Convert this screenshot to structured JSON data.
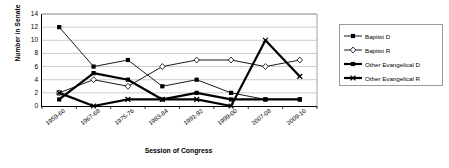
{
  "chart_data": {
    "type": "line",
    "title": "",
    "xlabel": "Session of Congress",
    "ylabel": "Number in Senate",
    "categories": [
      "1959-60",
      "1967-68",
      "1975-76",
      "1983-84",
      "1991-92",
      "1999-00",
      "2007-08",
      "2009-10"
    ],
    "ylim": [
      0,
      14
    ],
    "yticks": [
      0,
      2,
      4,
      6,
      8,
      10,
      12,
      14
    ],
    "grid": true,
    "grid_axis": "y",
    "legend_position": "right",
    "series": [
      {
        "name": "Baptist D",
        "marker": "filled-square",
        "line_width": "thin",
        "color": "#000000",
        "values": [
          12,
          6,
          7,
          3,
          4,
          2,
          1,
          1
        ]
      },
      {
        "name": "Baptist R",
        "marker": "open-diamond",
        "line_width": "thin",
        "color": "#000000",
        "values": [
          2,
          4,
          3,
          6,
          7,
          7,
          6,
          7
        ]
      },
      {
        "name": "Other Evangelical D",
        "marker": "filled-square",
        "line_width": "thick",
        "color": "#000000",
        "values": [
          1,
          5,
          4,
          1,
          2,
          1,
          1,
          1
        ]
      },
      {
        "name": "Other Evangelical R",
        "marker": "cross-x",
        "line_width": "thick",
        "color": "#000000",
        "values": [
          2,
          0,
          1,
          1,
          1,
          0,
          10,
          4.5
        ]
      }
    ]
  },
  "legend": {
    "entries": [
      "Baptist D",
      "Baptist R",
      "Other Evangelical D",
      "Other Evangelical R"
    ]
  },
  "axes": {
    "y_title": "Number in Senate",
    "x_title": "Session of Congress"
  }
}
